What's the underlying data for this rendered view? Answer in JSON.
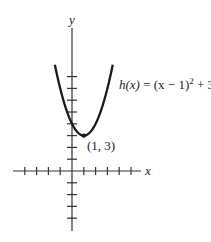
{
  "chart_data": {
    "type": "line",
    "title": "",
    "function_label": "h(x) = (x − 1)² + 3",
    "function_label_parts": {
      "lhs": "h(x)",
      "eq": " = (x − 1)",
      "exp": "2",
      "tail": " + 3"
    },
    "vertex": {
      "x": 1,
      "y": 3,
      "label": "(1, 3)"
    },
    "xlabel": "x",
    "ylabel": "y",
    "xlim": [
      -5,
      6
    ],
    "ylim": [
      -5,
      12
    ],
    "x_ticks": [
      -4,
      -3,
      -2,
      -1,
      1,
      2,
      3,
      4,
      5
    ],
    "y_ticks": [
      -4,
      -3,
      -2,
      -1,
      1,
      2,
      3,
      4,
      5,
      6,
      7,
      8
    ],
    "x_domain_plotted": [
      -1.45,
      3.45
    ],
    "series": [
      {
        "name": "h(x)",
        "x": [
          -1.45,
          -1,
          0,
          1,
          2,
          3,
          3.45
        ],
        "values": [
          9,
          7,
          4,
          3,
          4,
          7,
          9
        ]
      }
    ],
    "grid": false
  }
}
